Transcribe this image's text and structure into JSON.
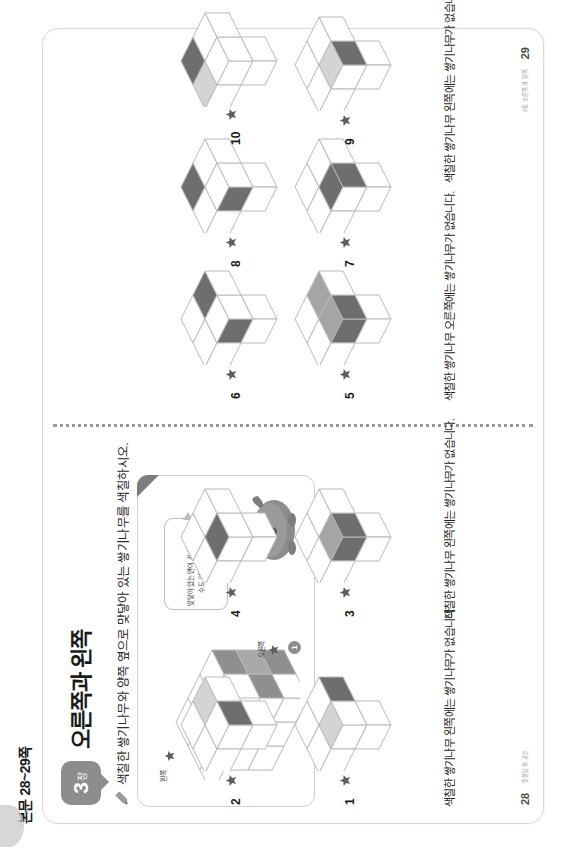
{
  "page_label": "본문 28~29쪽",
  "chapter": {
    "number": "3",
    "unit": "장",
    "badge_label": "알쏭달쏭 공간"
  },
  "title": "오른쪽과 왼쪽",
  "directive": "색칠한 쌓기나무와 양쪽 옆으로 맞닿아 있는 쌓기나무를 색칠하시오.",
  "example": {
    "left_label": "왼쪽",
    "right_label": "오른쪽",
    "marker": "1",
    "bubble_text": "맞닿아 있는 면이 꼭 보이지 않을 수도 있으니 조심해요!"
  },
  "notes": [
    "색칠한 쌓기나무 왼쪽에는 쌓기나무가 없습니다.",
    "색칠한 쌓기나무 왼쪽에는 쌓기나무가 없습니다.",
    "색칠한 쌓기나무 오른쪽에는 쌓기나무가 없습니다.",
    "색칠한 쌓기나무 왼쪽에는 쌓기나무가 없습니다."
  ],
  "problems": [
    {
      "num": "1",
      "starred": true
    },
    {
      "num": "2",
      "starred": true
    },
    {
      "num": "3",
      "starred": true
    },
    {
      "num": "4",
      "starred": true
    },
    {
      "num": "5",
      "starred": true
    },
    {
      "num": "6",
      "starred": true
    },
    {
      "num": "7",
      "starred": true
    },
    {
      "num": "8",
      "starred": true
    },
    {
      "num": "9",
      "starred": true
    },
    {
      "num": "10",
      "starred": true
    }
  ],
  "pagenums": {
    "left": "28",
    "right": "29"
  },
  "footers": {
    "left": "알쏭달쏭 공간",
    "right": "3장 오른쪽과 왼쪽"
  },
  "colors": {
    "ink": "#1a1a1a",
    "cube_outline": "#b9b9b9",
    "cube_top": "#ffffff",
    "cube_left": "#ffffff",
    "cube_right": "#ffffff",
    "fill_dark": "#6e6e6e",
    "fill_mid": "#a5a5a5",
    "fill_light": "#d6d6d6",
    "tab_gray": "#8d8d8d",
    "spine": "#9a9a9a"
  }
}
